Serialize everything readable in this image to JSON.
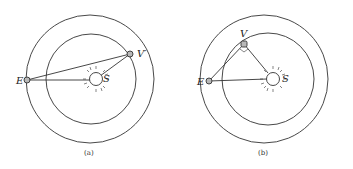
{
  "figures": [
    {
      "id": "a",
      "caption": "(a)",
      "labels": {
        "earth": "E",
        "venus": "V′",
        "sun": "S"
      },
      "center": [
        90,
        79
      ],
      "outer_radius": 64,
      "inner_radius": 45,
      "earth_pos": [
        27,
        80
      ],
      "venus_pos": [
        130,
        54
      ],
      "sun_pos": [
        96,
        79
      ]
    },
    {
      "id": "b",
      "caption": "(b)",
      "labels": {
        "earth": "E",
        "venus": "V",
        "sun": "S"
      },
      "center": [
        263,
        79
      ],
      "outer_radius": 64,
      "inner_radius": 46,
      "earth_pos": [
        209,
        81
      ],
      "venus_pos": [
        244,
        44
      ],
      "sun_pos": [
        273,
        79
      ],
      "right_angle_at_venus": true
    }
  ],
  "colors": {
    "line": "#333333",
    "planet_fill": "#b8b8b8"
  }
}
